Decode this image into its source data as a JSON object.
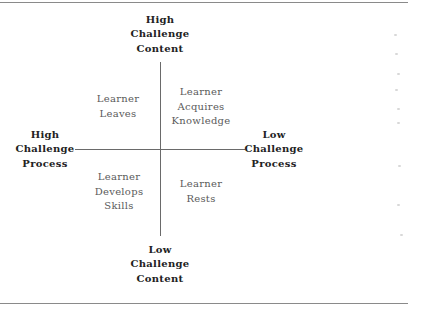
{
  "diagram": {
    "type": "quadrant",
    "axes": {
      "top": [
        "High",
        "Challenge",
        "Content"
      ],
      "bottom": [
        "Low",
        "Challenge",
        "Content"
      ],
      "left": [
        "High",
        "Challenge",
        "Process"
      ],
      "right": [
        "Low",
        "Challenge",
        "Process"
      ]
    },
    "quadrants": {
      "top_left": [
        "Learner",
        "Leaves"
      ],
      "top_right": [
        "Learner",
        "Acquires",
        "Knowledge"
      ],
      "bottom_left": [
        "Learner",
        "Develops",
        "Skills"
      ],
      "bottom_right": [
        "Learner",
        "Rests"
      ]
    }
  },
  "colors": {
    "axis_text": "#222222",
    "quadrant_text": "#5a5a5a",
    "axis_lines": "#6a6a6a",
    "rules": "#8a8a8a"
  }
}
